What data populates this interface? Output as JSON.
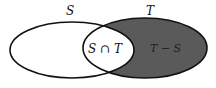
{
  "diagram": {
    "type": "venn",
    "sets": [
      {
        "name": "S",
        "label": "S"
      },
      {
        "name": "T",
        "label": "T"
      }
    ],
    "regions": [
      {
        "id": "intersection",
        "label": "S ∩ T",
        "shaded": false
      },
      {
        "id": "t-minus-s",
        "label": "T − S",
        "shaded": true
      }
    ],
    "colors": {
      "outline": "#111111",
      "shade": "#5a5a5a",
      "background": "#ffffff"
    }
  }
}
